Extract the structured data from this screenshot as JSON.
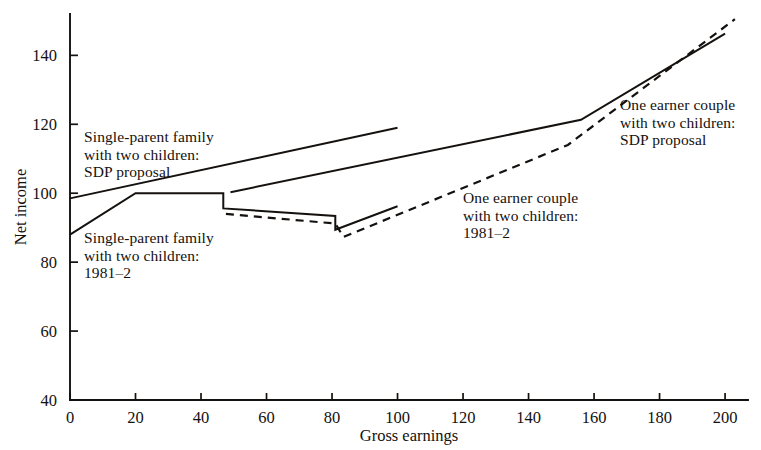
{
  "chart_data": {
    "type": "line",
    "title": "",
    "xlabel": "Gross  earnings",
    "ylabel": "Net income",
    "xlim": [
      0,
      207
    ],
    "ylim": [
      40,
      152
    ],
    "xticks": [
      0,
      20,
      40,
      60,
      80,
      100,
      120,
      140,
      160,
      180,
      200
    ],
    "yticks": [
      40,
      60,
      80,
      100,
      120,
      140
    ],
    "xtick_labels": [
      "0",
      "20",
      "40",
      "60",
      "80",
      "100",
      "120",
      "140",
      "160",
      "180",
      "200"
    ],
    "ytick_labels": [
      "40",
      "60",
      "80",
      "100",
      "120",
      "140"
    ],
    "grid": false,
    "legend": "inline-annotations",
    "series": [
      {
        "name": "Single-parent family with two children: SDP proposal",
        "style": "solid",
        "points": [
          [
            0,
            98.5
          ],
          [
            100,
            119.0
          ]
        ]
      },
      {
        "name": "Single-parent family with two children: 1981-2",
        "style": "solid",
        "points": [
          [
            0,
            88.0
          ],
          [
            20,
            100.0
          ],
          [
            46.8,
            100.0
          ],
          [
            46.8,
            95.6
          ],
          [
            81.0,
            93.4
          ],
          [
            81.0,
            89.4
          ],
          [
            100.0,
            96.2
          ]
        ]
      },
      {
        "name": "One earner couple with two children: SDP proposal",
        "style": "solid",
        "points": [
          [
            49.0,
            100.3
          ],
          [
            156.0,
            121.3
          ],
          [
            200.0,
            146.3
          ]
        ]
      },
      {
        "name": "One earner couple with two children: 1981-2",
        "style": "dashed",
        "points": [
          [
            47.6,
            94.0
          ],
          [
            81.0,
            91.2
          ],
          [
            83.5,
            87.3
          ],
          [
            152.0,
            114.0
          ],
          [
            203.0,
            150.5
          ]
        ]
      }
    ]
  },
  "annotations": [
    {
      "id": "single-parent-sdp",
      "lines": [
        "Single-parent family",
        "with two children:",
        "SDP proposal"
      ]
    },
    {
      "id": "single-parent-1981",
      "lines": [
        "Single-parent family",
        "with two children:",
        "1981–2"
      ]
    },
    {
      "id": "one-earner-1981",
      "lines": [
        "One earner couple",
        "with two children:",
        "1981–2"
      ]
    },
    {
      "id": "one-earner-sdp",
      "lines": [
        "One earner couple",
        "with two children:",
        "SDP proposal"
      ]
    }
  ],
  "axes": {
    "y_axis_title": "Net income",
    "x_axis_title": "Gross  earnings"
  },
  "colors": {
    "ink": "#14110f",
    "background": "#ffffff"
  }
}
